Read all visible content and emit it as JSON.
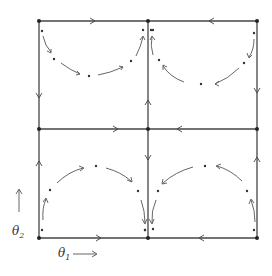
{
  "diagram": {
    "title": "",
    "type": "phase-portrait-grid",
    "colors": {
      "line": "#444444",
      "dot": "#333333",
      "background": "#ffffff"
    },
    "grid": {
      "x": [
        39,
        148,
        257
      ],
      "y": [
        21,
        129,
        238
      ]
    },
    "axes": {
      "x_label": "θ",
      "x_sub": "1",
      "y_label": "θ",
      "y_sub": "2"
    },
    "edge_flows": [
      {
        "edge": "top-left",
        "direction": "right"
      },
      {
        "edge": "top-right",
        "direction": "left"
      },
      {
        "edge": "middle-left",
        "direction": "right"
      },
      {
        "edge": "middle-right",
        "direction": "left"
      },
      {
        "edge": "bottom-left",
        "direction": "right"
      },
      {
        "edge": "bottom-right",
        "direction": "left"
      },
      {
        "edge": "left-upper",
        "direction": "down"
      },
      {
        "edge": "left-lower",
        "direction": "up"
      },
      {
        "edge": "center-upper",
        "direction": "up"
      },
      {
        "edge": "center-lower",
        "direction": "down"
      },
      {
        "edge": "right-upper",
        "direction": "down"
      },
      {
        "edge": "right-lower",
        "direction": "up"
      }
    ],
    "cells": [
      {
        "name": "top-left",
        "trajectory": "clockwise arc from left edge to center edge, sagging downward"
      },
      {
        "name": "top-right",
        "trajectory": "counterclockwise arc from right edge to center edge, sagging downward"
      },
      {
        "name": "bottom-left",
        "trajectory": "clockwise arc from left edge over top to center edge"
      },
      {
        "name": "bottom-right",
        "trajectory": "counterclockwise arc from right edge over top to center edge"
      }
    ]
  }
}
